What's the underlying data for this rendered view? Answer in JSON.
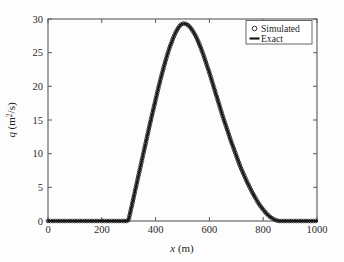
{
  "chart_data": {
    "type": "line",
    "title": "",
    "xlabel": "x (m)",
    "ylabel": "q (m2/s)",
    "ylabel_parts": {
      "symbol": "q",
      "units_pre": " (m",
      "exponent": "2",
      "units_post": "/s)"
    },
    "xlabel_parts": {
      "symbol": "x",
      "units": " (m)"
    },
    "xlim": [
      0,
      1000
    ],
    "ylim": [
      0,
      30
    ],
    "xticks": [
      0,
      200,
      400,
      600,
      800,
      1000
    ],
    "yticks": [
      0,
      5,
      10,
      15,
      20,
      25,
      30
    ],
    "xtick_labels": [
      "0",
      "200",
      "400",
      "600",
      "800",
      "1000"
    ],
    "ytick_labels": [
      "0",
      "5",
      "10",
      "15",
      "20",
      "25",
      "30"
    ],
    "grid": false,
    "legend_position": "upper right",
    "peak": {
      "x": 500,
      "y": 29.3
    },
    "series": [
      {
        "name": "Simulated",
        "style": "markers",
        "marker": "open-circle",
        "color": "#1c1c1c",
        "x": [
          0,
          20,
          40,
          60,
          80,
          100,
          120,
          140,
          160,
          180,
          200,
          220,
          240,
          260,
          280,
          290,
          295,
          300,
          310,
          320,
          330,
          340,
          350,
          360,
          370,
          380,
          390,
          400,
          410,
          420,
          430,
          440,
          450,
          460,
          470,
          480,
          490,
          500,
          510,
          520,
          530,
          540,
          550,
          560,
          570,
          580,
          590,
          600,
          610,
          620,
          630,
          640,
          650,
          660,
          670,
          680,
          690,
          700,
          710,
          720,
          730,
          740,
          750,
          760,
          770,
          780,
          790,
          800,
          810,
          820,
          830,
          840,
          850,
          860,
          880,
          900,
          920,
          940,
          960,
          980,
          1000
        ],
        "y": [
          0,
          0,
          0,
          0,
          0,
          0,
          0,
          0,
          0,
          0,
          0,
          0,
          0,
          0,
          0,
          0,
          0,
          0.3,
          2.0,
          3.8,
          5.6,
          7.4,
          9.2,
          11.0,
          12.8,
          14.6,
          16.3,
          18.0,
          19.7,
          21.3,
          22.8,
          24.2,
          25.5,
          26.6,
          27.6,
          28.4,
          29.0,
          29.3,
          29.3,
          29.1,
          28.7,
          28.1,
          27.4,
          26.5,
          25.5,
          24.4,
          23.2,
          22.0,
          20.7,
          19.4,
          18.1,
          16.8,
          15.5,
          14.3,
          13.1,
          11.9,
          10.8,
          9.7,
          8.6,
          7.6,
          6.7,
          5.8,
          5.0,
          4.2,
          3.5,
          2.8,
          2.2,
          1.7,
          1.2,
          0.8,
          0.5,
          0.25,
          0.08,
          0.0,
          0,
          0,
          0,
          0,
          0,
          0,
          0
        ]
      },
      {
        "name": "Exact",
        "style": "line",
        "color": "#121212",
        "x": [
          0,
          20,
          40,
          60,
          80,
          100,
          120,
          140,
          160,
          180,
          200,
          220,
          240,
          260,
          280,
          290,
          295,
          300,
          310,
          320,
          330,
          340,
          350,
          360,
          370,
          380,
          390,
          400,
          410,
          420,
          430,
          440,
          450,
          460,
          470,
          480,
          490,
          500,
          510,
          520,
          530,
          540,
          550,
          560,
          570,
          580,
          590,
          600,
          610,
          620,
          630,
          640,
          650,
          660,
          670,
          680,
          690,
          700,
          710,
          720,
          730,
          740,
          750,
          760,
          770,
          780,
          790,
          800,
          810,
          820,
          830,
          840,
          850,
          860,
          880,
          900,
          920,
          940,
          960,
          980,
          1000
        ],
        "y": [
          0,
          0,
          0,
          0,
          0,
          0,
          0,
          0,
          0,
          0,
          0,
          0,
          0,
          0,
          0,
          0,
          0,
          0.3,
          2.0,
          3.8,
          5.6,
          7.4,
          9.2,
          11.0,
          12.8,
          14.6,
          16.3,
          18.0,
          19.7,
          21.3,
          22.8,
          24.2,
          25.5,
          26.6,
          27.6,
          28.4,
          29.0,
          29.3,
          29.3,
          29.1,
          28.7,
          28.1,
          27.4,
          26.5,
          25.5,
          24.4,
          23.2,
          22.0,
          20.7,
          19.4,
          18.1,
          16.8,
          15.5,
          14.3,
          13.1,
          11.9,
          10.8,
          9.7,
          8.6,
          7.6,
          6.7,
          5.8,
          5.0,
          4.2,
          3.5,
          2.8,
          2.2,
          1.7,
          1.2,
          0.8,
          0.5,
          0.25,
          0.08,
          0.0,
          0,
          0,
          0,
          0,
          0,
          0,
          0
        ]
      }
    ],
    "legend": [
      {
        "label": "Simulated",
        "marker": "open-circle"
      },
      {
        "label": "Exact",
        "marker": "line"
      }
    ]
  }
}
